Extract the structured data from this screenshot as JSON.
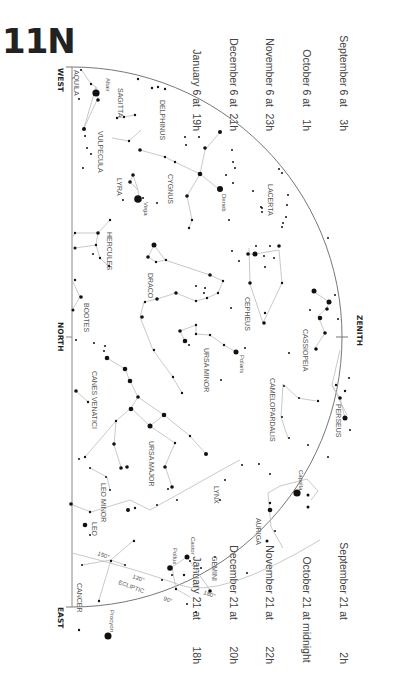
{
  "title": "11N",
  "times_top": [
    {
      "date": "September 6 at",
      "time": "3h"
    },
    {
      "date": "October 6 at",
      "time": "1h"
    },
    {
      "date": "November 6 at",
      "time": "23h"
    },
    {
      "date": "December 6 at",
      "time": "21h"
    },
    {
      "date": "January 6 at",
      "time": "19h"
    }
  ],
  "times_bottom": [
    {
      "date": "September 21 at",
      "time": "2h"
    },
    {
      "date": "October 21 at",
      "time": "midnight"
    },
    {
      "date": "November 21 at",
      "time": "22h"
    },
    {
      "date": "December 21 at",
      "time": "20h"
    },
    {
      "date": "January 21 at",
      "time": "18h"
    }
  ],
  "directions": {
    "west": "WEST",
    "north": "NORTH",
    "east": "EAST",
    "zenith": "ZENITH"
  },
  "constellations": [
    "AQUILA",
    "SAGITTA",
    "DELPHINUS",
    "VULPECULA",
    "LYRA",
    "CYGNUS",
    "LACERTA",
    "HERCULES",
    "DRACO",
    "CEPHEUS",
    "CASSIOPEIA",
    "BOOTES",
    "URSA MINOR",
    "CAMELOPARDALIS",
    "PERSEUS",
    "CANES VENATICI",
    "URSA MAJOR",
    "LEO MINOR",
    "LYNX",
    "AURIGA",
    "LEO",
    "GEMINI",
    "CANCER"
  ],
  "stars": [
    "Altair",
    "Vega",
    "Deneb",
    "Polaris",
    "Capella",
    "Castor",
    "Pollux",
    "Procyon"
  ],
  "ecliptic": {
    "label": "ECLIPTIC",
    "marks": [
      "150°",
      "120°",
      "90°",
      "180°"
    ]
  },
  "colors": {
    "ink": "#222222",
    "line": "#bbbbbb",
    "horizon": "#777777"
  }
}
